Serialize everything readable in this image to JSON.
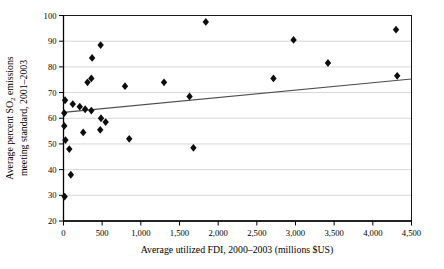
{
  "figure": {
    "background": "#ffffff"
  },
  "chart_data": {
    "type": "scatter",
    "title": "",
    "xlabel": "Average utilized FDI, 2000–2003 (millions $US)",
    "ylabel": "Average percent SO₂ emissions meeting standard, 2001–2003",
    "ylabel_lines": [
      {
        "parts": [
          {
            "text": "Average percent SO"
          },
          {
            "text": "2",
            "subscript": true
          },
          {
            "text": " emissions"
          }
        ]
      },
      {
        "parts": [
          {
            "text": "meeting standard, 2001–2003"
          }
        ]
      }
    ],
    "xlim": [
      0,
      4500
    ],
    "ylim": [
      20,
      100
    ],
    "x_ticks": {
      "values": [
        0,
        500,
        1000,
        1500,
        2000,
        2500,
        3000,
        3500,
        4000,
        4500
      ],
      "labels": [
        "0",
        "500",
        "1,000",
        "1,500",
        "2,000",
        "2,500",
        "3,000",
        "3,500",
        "4,000",
        "4,500"
      ]
    },
    "y_ticks": {
      "values": [
        20,
        30,
        40,
        50,
        60,
        70,
        80,
        90,
        100
      ],
      "labels": [
        "20",
        "30",
        "40",
        "50",
        "60",
        "70",
        "80",
        "90",
        "100"
      ]
    },
    "grid": {
      "horizontal": true,
      "vertical": false,
      "color": "#d8d8d8"
    },
    "legend": "none",
    "marker": {
      "shape": "diamond",
      "color": "#0d0d0d"
    },
    "trend_line": {
      "x_start": 0,
      "y_start": 62.3,
      "x_end": 4500,
      "y_end": 75.3,
      "color": "#4d4d4d"
    },
    "points": [
      [
        20,
        67
      ],
      [
        10,
        62
      ],
      [
        120,
        65.5
      ],
      [
        210,
        64.5
      ],
      [
        280,
        63.5
      ],
      [
        360,
        63
      ],
      [
        310,
        74
      ],
      [
        360,
        75.5
      ],
      [
        370,
        83.5
      ],
      [
        480,
        88.5
      ],
      [
        485,
        60
      ],
      [
        545,
        58.5
      ],
      [
        475,
        55.5
      ],
      [
        255,
        54.5
      ],
      [
        10,
        57
      ],
      [
        25,
        51.5
      ],
      [
        75,
        48
      ],
      [
        95,
        38
      ],
      [
        15,
        29.5
      ],
      [
        850,
        52
      ],
      [
        795,
        72.5
      ],
      [
        1300,
        74
      ],
      [
        1630,
        68.5
      ],
      [
        1680,
        48.5
      ],
      [
        1840,
        97.5
      ],
      [
        2715,
        75.5
      ],
      [
        2975,
        90.5
      ],
      [
        3420,
        81.5
      ],
      [
        4300,
        94.5
      ],
      [
        4315,
        76.5
      ]
    ]
  }
}
